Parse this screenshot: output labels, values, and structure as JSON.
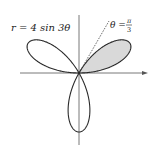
{
  "diagram": {
    "type": "polar-rose",
    "equation_label": "r = 4 sin 3θ",
    "equation": {
      "r_coef": 4,
      "trig": "sin",
      "k": 3
    },
    "ray_label": {
      "lhs": "θ =",
      "numerator": "π",
      "denominator": "3"
    },
    "ray_angle_rad_fraction": "π/3",
    "shaded_petal": {
      "theta_start": 0,
      "theta_end": "π/3",
      "fill": "#d9d9d9"
    },
    "colors": {
      "curve": "#2a2a2a",
      "axes": "#555555",
      "shade": "#d9d9d9",
      "dashed_ray": "#333333",
      "background": "#ffffff"
    },
    "axes": {
      "x_arrow": true,
      "y_arrow": false
    }
  }
}
